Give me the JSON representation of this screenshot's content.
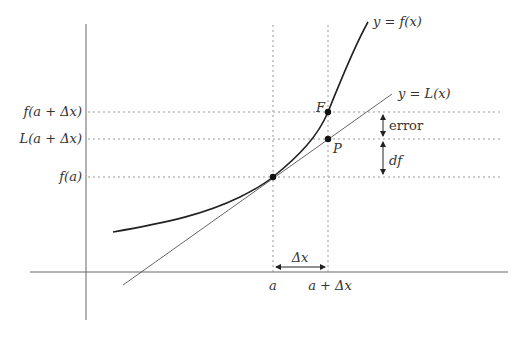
{
  "diagram": {
    "curve_label": "y = f(x)",
    "tangent_label": "y = L(x)",
    "y_labels": {
      "f_a_dx": "f(a + Δx)",
      "L_a_dx": "L(a + Δx)",
      "f_a": "f(a)"
    },
    "x_labels": {
      "a": "a",
      "a_dx": "a + Δx"
    },
    "points": {
      "F": "F",
      "P": "P"
    },
    "annotations": {
      "error": "error",
      "df": "df",
      "delta_x": "Δx"
    },
    "colors": {
      "curve": "#222222",
      "tangent": "#555555",
      "axes": "#666666",
      "guides": "#999999"
    }
  }
}
